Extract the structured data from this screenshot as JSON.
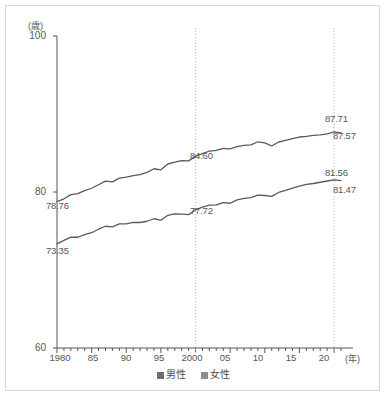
{
  "chart_data": {
    "type": "line",
    "title": "",
    "xlabel": "(年)",
    "ylabel": "(歳)",
    "xlim": [
      1980,
      2021
    ],
    "ylim": [
      60,
      100
    ],
    "grid": false,
    "legend_position": "bottom-center",
    "y_ticks": [
      "100",
      "80",
      "60"
    ],
    "y_tick_values": [
      100,
      80,
      60
    ],
    "x_ticks": [
      "1980",
      "85",
      "90",
      "95",
      "2000",
      "05",
      "10",
      "15",
      "20"
    ],
    "x_tick_values": [
      1980,
      1985,
      1990,
      1995,
      2000,
      2005,
      2010,
      2015,
      2020
    ],
    "x": [
      1980,
      1981,
      1982,
      1983,
      1984,
      1985,
      1986,
      1987,
      1988,
      1989,
      1990,
      1991,
      1992,
      1993,
      1994,
      1995,
      1996,
      1997,
      1998,
      1999,
      2000,
      2001,
      2002,
      2003,
      2004,
      2005,
      2006,
      2007,
      2008,
      2009,
      2010,
      2011,
      2012,
      2013,
      2014,
      2015,
      2016,
      2017,
      2018,
      2019,
      2020,
      2021
    ],
    "series": [
      {
        "name": "女性",
        "key": "female",
        "color": "#5a5a5a",
        "values": [
          78.76,
          79.13,
          79.66,
          79.78,
          80.18,
          80.48,
          80.93,
          81.39,
          81.3,
          81.77,
          81.9,
          82.11,
          82.22,
          82.51,
          82.98,
          82.85,
          83.59,
          83.82,
          84.01,
          83.99,
          84.6,
          84.93,
          85.23,
          85.33,
          85.59,
          85.52,
          85.81,
          85.99,
          86.05,
          86.44,
          86.3,
          85.9,
          86.41,
          86.61,
          86.83,
          87.05,
          87.14,
          87.26,
          87.32,
          87.45,
          87.71,
          87.57
        ]
      },
      {
        "name": "男性",
        "key": "male",
        "color": "#5a5a5a",
        "values": [
          73.35,
          73.79,
          74.22,
          74.2,
          74.54,
          74.78,
          75.23,
          75.61,
          75.54,
          75.91,
          75.92,
          76.11,
          76.09,
          76.25,
          76.57,
          76.38,
          77.01,
          77.19,
          77.16,
          77.1,
          77.72,
          78.07,
          78.32,
          78.36,
          78.64,
          78.56,
          79.0,
          79.19,
          79.29,
          79.59,
          79.55,
          79.44,
          79.94,
          80.21,
          80.5,
          80.75,
          80.98,
          81.09,
          81.25,
          81.41,
          81.56,
          81.47
        ]
      }
    ],
    "annotations": [
      {
        "id": "female-start",
        "text": "78.76",
        "series": "female",
        "year": 1980,
        "value": 78.76
      },
      {
        "id": "male-start",
        "text": "73.35",
        "series": "male",
        "year": 1980,
        "value": 73.35
      },
      {
        "id": "female-2000",
        "text": "84.60",
        "series": "female",
        "year": 2000,
        "value": 84.6
      },
      {
        "id": "male-2000",
        "text": "77.72",
        "series": "male",
        "year": 2000,
        "value": 77.72
      },
      {
        "id": "female-2020",
        "text": "87.71",
        "series": "female",
        "year": 2020,
        "value": 87.71
      },
      {
        "id": "female-2021",
        "text": "87.57",
        "series": "female",
        "year": 2021,
        "value": 87.57
      },
      {
        "id": "male-2020",
        "text": "81.56",
        "series": "male",
        "year": 2020,
        "value": 81.56
      },
      {
        "id": "male-2021",
        "text": "81.47",
        "series": "male",
        "year": 2021,
        "value": 81.47
      }
    ],
    "reference_lines": [
      {
        "id": "ref-2000",
        "year": 2000,
        "style": "dotted"
      },
      {
        "id": "ref-2020",
        "year": 2020,
        "style": "dotted"
      }
    ]
  },
  "axes": {
    "y_unit": "(歳)",
    "x_unit": "(年)",
    "y_tick_0": "100",
    "y_tick_1": "80",
    "y_tick_2": "60",
    "x_tick_0": "1980",
    "x_tick_1": "85",
    "x_tick_2": "90",
    "x_tick_3": "95",
    "x_tick_4": "2000",
    "x_tick_5": "05",
    "x_tick_6": "10",
    "x_tick_7": "15",
    "x_tick_8": "20"
  },
  "legend": {
    "items": [
      {
        "label": "男性",
        "key": "male"
      },
      {
        "label": "女性",
        "key": "female"
      }
    ]
  },
  "labels": {
    "female_start": "78.76",
    "male_start": "73.35",
    "female_mid": "84.60",
    "male_mid": "77.72",
    "female_peak": "87.71",
    "female_end": "87.57",
    "male_peak": "81.56",
    "male_end": "81.47"
  },
  "colors": {
    "line": "#5a5a5a",
    "axis": "#555555",
    "reference": "#bbbbbb",
    "border": "#d8d8d8",
    "text": "#555555"
  }
}
